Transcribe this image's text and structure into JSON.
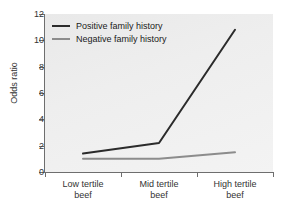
{
  "chart_data": {
    "type": "line",
    "title": "",
    "xlabel": "",
    "ylabel": "Odds ratio",
    "categories": [
      "Low tertile beef",
      "Mid tertile beef",
      "High tertile beef"
    ],
    "category_lines": [
      [
        "Low tertile",
        "beef"
      ],
      [
        "Mid tertile",
        "beef"
      ],
      [
        "High tertile",
        "beef"
      ]
    ],
    "series": [
      {
        "name": "Positive family history",
        "color": "#2b2b2b",
        "values": [
          1.4,
          2.2,
          10.8
        ]
      },
      {
        "name": "Negative family history",
        "color": "#8c8c8c",
        "values": [
          1.0,
          1.0,
          1.5
        ]
      }
    ],
    "ylim": [
      0,
      12
    ],
    "yticks": [
      0,
      2,
      4,
      6,
      8,
      10,
      12
    ],
    "ytick_labels": [
      "0",
      "2",
      "4",
      "6",
      "8",
      "10",
      "12"
    ],
    "grid": false,
    "legend_position": "top-left"
  },
  "legend": {
    "items": [
      {
        "label": "Positive family history",
        "color": "#2b2b2b"
      },
      {
        "label": "Negative family history",
        "color": "#8c8c8c"
      }
    ]
  },
  "axes": {
    "y_title": "Odds ratio"
  },
  "colors": {
    "panel_background": "#eeeeee",
    "page_background": "#ffffff",
    "axis": "#6e6e6e",
    "text": "#333333",
    "series_positive": "#2b2b2b",
    "series_negative": "#8c8c8c"
  }
}
